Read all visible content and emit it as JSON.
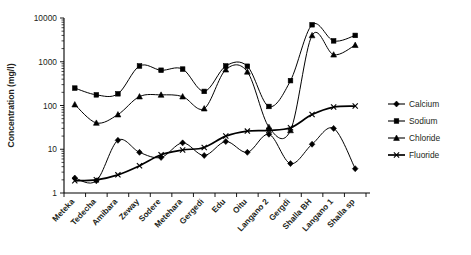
{
  "chart_data": {
    "type": "line",
    "title": "",
    "xlabel": "",
    "ylabel": "Concentration (mg/l)",
    "yscale": "log",
    "ylim": [
      1,
      10000
    ],
    "ytick_labels": [
      "1",
      "10",
      "100",
      "1000",
      "10000"
    ],
    "ytick_values": [
      1,
      10,
      100,
      1000,
      10000
    ],
    "grid": false,
    "legend_position": "right",
    "categories": [
      "Meteka",
      "Tedecha",
      "Amibara",
      "Zeway",
      "Sodere",
      "Metehara",
      "Gergedi",
      "Edu",
      "Oitu",
      "Langano 2",
      "Gergdi",
      "Shalla BH",
      "Langano 1",
      "Shalla sp"
    ],
    "series": [
      {
        "name": "Calcium",
        "marker": "diamond",
        "values": [
          2.2,
          1.9,
          16,
          8.5,
          6.5,
          14,
          7.2,
          15,
          8.5,
          22,
          4.7,
          13,
          30,
          3.6
        ]
      },
      {
        "name": "Sodium",
        "marker": "square",
        "values": [
          250,
          175,
          185,
          800,
          640,
          680,
          210,
          800,
          790,
          95,
          370,
          7000,
          3000,
          4000
        ]
      },
      {
        "name": "Chloride",
        "marker": "triangle",
        "values": [
          105,
          40,
          62,
          160,
          175,
          160,
          85,
          660,
          590,
          32,
          27,
          4000,
          1450,
          2400
        ]
      },
      {
        "name": "Fluoride",
        "marker": "cross",
        "values": [
          1.9,
          2.0,
          2.6,
          4.2,
          7.5,
          9.6,
          11,
          20,
          26,
          27,
          31,
          62,
          92,
          97
        ]
      }
    ]
  },
  "legend": {
    "items": [
      {
        "label": "Calcium"
      },
      {
        "label": "Sodium"
      },
      {
        "label": "Chloride"
      },
      {
        "label": "Fluoride"
      }
    ]
  },
  "colors": {
    "line": "#000000",
    "text": "#231f20",
    "background": "#ffffff"
  }
}
